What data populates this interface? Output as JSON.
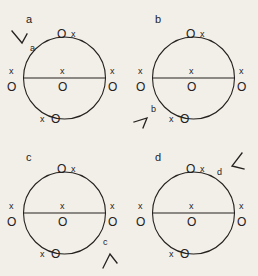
{
  "figure": {
    "title": "",
    "background_color": "#f2efe9",
    "ink_color": "#24211e",
    "symbols": {
      "into_page": "x",
      "out_of_page": "O"
    },
    "panels": [
      {
        "id": "a",
        "label": "a",
        "annotation_label": "a",
        "annotation_position": "top-left-outside",
        "annotation_marker": "angle-arrow-down-right",
        "circle": {
          "diameter_line": "horizontal",
          "markers": {
            "top": {
              "left": "O",
              "right": "x"
            },
            "bottom": {
              "left": "x",
              "right": "O"
            },
            "left": {
              "above": "x",
              "below": "O"
            },
            "right": {
              "above": "x",
              "below": "O"
            },
            "center": {
              "above": "x",
              "below": "O"
            }
          }
        }
      },
      {
        "id": "b",
        "label": "b",
        "annotation_label": "b",
        "annotation_position": "bottom-left-outside",
        "annotation_marker": "angle-arrow-up-right",
        "circle": {
          "diameter_line": "horizontal",
          "markers": {
            "top": {
              "left": "O",
              "right": "x"
            },
            "bottom": {
              "left": "x",
              "right": "O"
            },
            "left": {
              "above": "x",
              "below": "O"
            },
            "right": {
              "above": "x",
              "below": "O"
            },
            "center": {
              "above": "x",
              "below": "O"
            }
          }
        }
      },
      {
        "id": "c",
        "label": "c",
        "annotation_label": "c",
        "annotation_position": "bottom-right-outside",
        "annotation_marker": "angle-arrow-up",
        "circle": {
          "diameter_line": "horizontal",
          "markers": {
            "top": {
              "left": "O",
              "right": "x"
            },
            "bottom": {
              "left": "x",
              "right": "O"
            },
            "left": {
              "above": "x",
              "below": "O"
            },
            "right": {
              "above": "x",
              "below": "O"
            },
            "center": {
              "above": "x",
              "below": "O"
            }
          }
        }
      },
      {
        "id": "d",
        "label": "d",
        "annotation_label": "d",
        "annotation_position": "top-right-outside",
        "annotation_marker": "angle-arrow-down-left",
        "circle": {
          "diameter_line": "horizontal",
          "markers": {
            "top": {
              "left": "O",
              "right": "x"
            },
            "bottom": {
              "left": "x",
              "right": "O"
            },
            "left": {
              "above": "x",
              "below": "O"
            },
            "right": {
              "above": "x",
              "below": "O"
            },
            "center": {
              "above": "x",
              "below": "O"
            }
          }
        }
      }
    ]
  }
}
